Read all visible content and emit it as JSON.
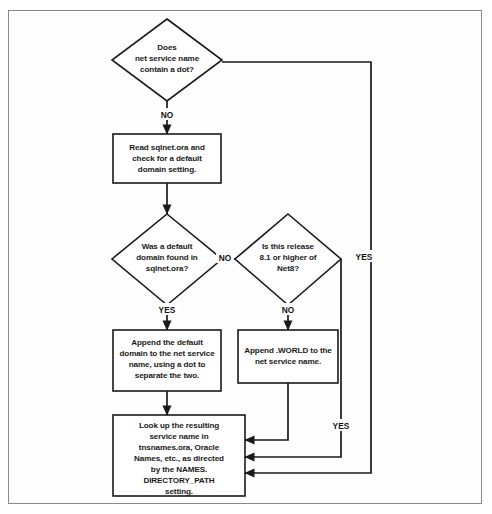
{
  "figure": {
    "border_color": "#8a8a8a",
    "line_color": "#1a1a1a",
    "background": "#ffffff"
  },
  "nodes": {
    "decision_dot": {
      "type": "decision",
      "lines": [
        "Does",
        "net service name",
        "contain a dot?"
      ]
    },
    "process_read_sqlnet": {
      "type": "process",
      "lines": [
        "Read sqlnet.ora and",
        "check for a default",
        "domain setting."
      ]
    },
    "decision_default_domain": {
      "type": "decision",
      "lines": [
        "Was a default",
        "domain found in",
        "sqlnet.ora?"
      ]
    },
    "decision_net8_release": {
      "type": "decision",
      "lines": [
        "Is this release",
        "8.1 or higher of",
        "Net8?"
      ]
    },
    "process_append_domain": {
      "type": "process",
      "lines": [
        "Append the default",
        "domain to the net service",
        "name, using a dot to",
        "separate the two."
      ]
    },
    "process_append_world": {
      "type": "process",
      "lines": [
        "Append .WORLD to the",
        "net service name."
      ]
    },
    "process_lookup": {
      "type": "process",
      "lines": [
        "Look up the resulting",
        "service name in",
        "tnsnames.ora, Oracle",
        "Names, etc., as directed",
        "by the NAMES.",
        "DIRECTORY_PATH",
        "setting."
      ]
    }
  },
  "edge_labels": {
    "dot_no": "NO",
    "dot_yes": "YES",
    "default_domain_yes": "YES",
    "default_domain_no": "NO",
    "net8_no": "NO",
    "net8_yes": "YES"
  }
}
